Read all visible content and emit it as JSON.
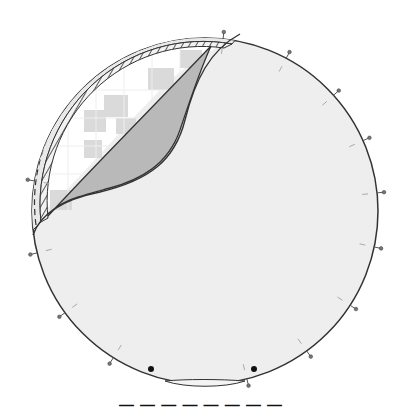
{
  "figure": {
    "colors": {
      "sheet_fill": "#eeeeee",
      "sheet_stroke": "#333333",
      "underside_fill": "#b9b9b9",
      "exposed_fill": "#ffffff",
      "grid_blocks": "#d3d3d3",
      "band_fill": "#e9e9e9",
      "pin_color": "#555555",
      "dot_color": "#111111"
    },
    "circle": {
      "cx": 205,
      "cy": 211,
      "r": 173
    },
    "pins": {
      "outer_angles_deg": [
        -84,
        -62,
        -42,
        -24,
        -6,
        12,
        33,
        54,
        76,
        122,
        144,
        166,
        190
      ],
      "count": 13
    },
    "markers": [
      {
        "name": "dot-left",
        "x": 151,
        "y": 369
      },
      {
        "name": "dot-right",
        "x": 254,
        "y": 369
      }
    ],
    "labels": {
      "peeled_region": "peeled corner (underside)",
      "exposed_region": "exposed substrate grid",
      "band_dashed": "dashed outer band",
      "band_hatched": "hatched inner band"
    }
  },
  "caption": "— — — — — — — —"
}
